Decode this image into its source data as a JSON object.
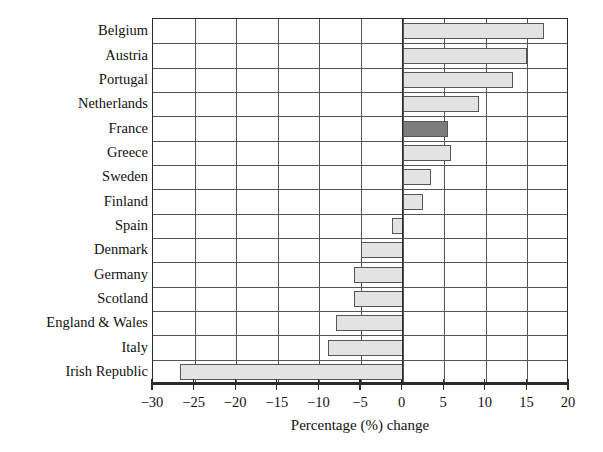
{
  "chart_data": {
    "type": "bar",
    "orientation": "horizontal",
    "title": "",
    "subtitle": "",
    "xlabel": "Percentage (%) change",
    "ylabel": "",
    "xlim": [
      -30,
      20
    ],
    "ylim": null,
    "grid": true,
    "legend": null,
    "xticks": [
      -30,
      -25,
      -20,
      -15,
      -10,
      -5,
      0,
      5,
      10,
      15,
      20
    ],
    "xtick_labels": [
      "−30",
      "−25",
      "−20",
      "−15",
      "−10",
      "−5",
      "0",
      "5",
      "10",
      "15",
      "20"
    ],
    "categories": [
      "Belgium",
      "Austria",
      "Portugal",
      "Netherlands",
      "France",
      "Greece",
      "Sweden",
      "Finland",
      "Spain",
      "Denmark",
      "Germany",
      "Scotland",
      "England & Wales",
      "Italy",
      "Irish Republic"
    ],
    "values": [
      17.0,
      15.0,
      13.3,
      9.2,
      5.4,
      5.8,
      3.4,
      2.5,
      -1.3,
      -5.0,
      -5.9,
      -5.8,
      -8.0,
      -9.0,
      -26.7
    ],
    "colors": {
      "bar_default_fill": "#e3e3e3",
      "bar_highlight_fill": "#7d7d7d",
      "bar_stroke": "#565656",
      "axis": "#2b2b2b",
      "grid": "#555555",
      "background": "#ffffff",
      "text": "#111111"
    },
    "highlighted_category": "France",
    "annotations": []
  }
}
